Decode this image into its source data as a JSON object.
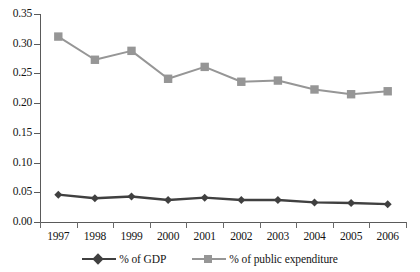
{
  "chart_data": {
    "type": "line",
    "title": "",
    "xlabel": "",
    "ylabel": "",
    "categories": [
      "1997",
      "1998",
      "1999",
      "2000",
      "2001",
      "2002",
      "2003",
      "2004",
      "2005",
      "2006"
    ],
    "series": [
      {
        "name": "% of GDP",
        "color": "#404040",
        "marker": "diamond",
        "values": [
          0.046,
          0.04,
          0.043,
          0.037,
          0.041,
          0.037,
          0.037,
          0.033,
          0.032,
          0.03
        ]
      },
      {
        "name": "% of public  expenditure",
        "color": "#969696",
        "marker": "square",
        "values": [
          0.312,
          0.273,
          0.288,
          0.241,
          0.261,
          0.236,
          0.238,
          0.223,
          0.215,
          0.22
        ]
      }
    ],
    "ylim": [
      0.0,
      0.35
    ],
    "ytick_values": [
      0.0,
      0.05,
      0.1,
      0.15,
      0.2,
      0.25,
      0.3,
      0.35
    ],
    "ytick_labels": [
      "0.00",
      "0.05",
      "0.10",
      "0.15",
      "0.20",
      "0.25",
      "0.30",
      "0.35"
    ],
    "grid": false,
    "legend_position": "bottom",
    "axis_color": "#5a5a5a",
    "background": "#ffffff"
  },
  "legend": {
    "entries": [
      {
        "label": "% of GDP"
      },
      {
        "label": "% of public  expenditure"
      }
    ]
  }
}
